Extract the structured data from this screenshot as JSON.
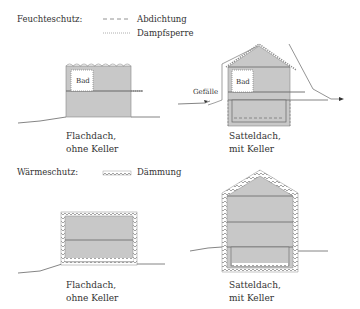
{
  "top_section": {
    "title": "Feuchteschutz:",
    "legend": [
      {
        "style": "dashed",
        "label": "Abdichtung"
      },
      {
        "style": "dotted",
        "label": "Dampfsperre"
      }
    ],
    "left_house": {
      "room_label": "Bad",
      "caption_line1": "Flachdach,",
      "caption_line2": "ohne Keller"
    },
    "right_house": {
      "room_label": "Bad",
      "slope_label": "Gefälle",
      "caption_line1": "Satteldach,",
      "caption_line2": "mit Keller"
    }
  },
  "bottom_section": {
    "title": "Wärmeschutz:",
    "legend": [
      {
        "style": "wavy",
        "label": "Dämmung"
      }
    ],
    "left_house": {
      "caption_line1": "Flachdach,",
      "caption_line2": "ohne Keller"
    },
    "right_house": {
      "caption_line1": "Satteldach,",
      "caption_line2": "mit Keller"
    }
  },
  "colors": {
    "fill": "#c8c8c8",
    "line": "#555555",
    "text": "#333333",
    "background": "#ffffff"
  }
}
